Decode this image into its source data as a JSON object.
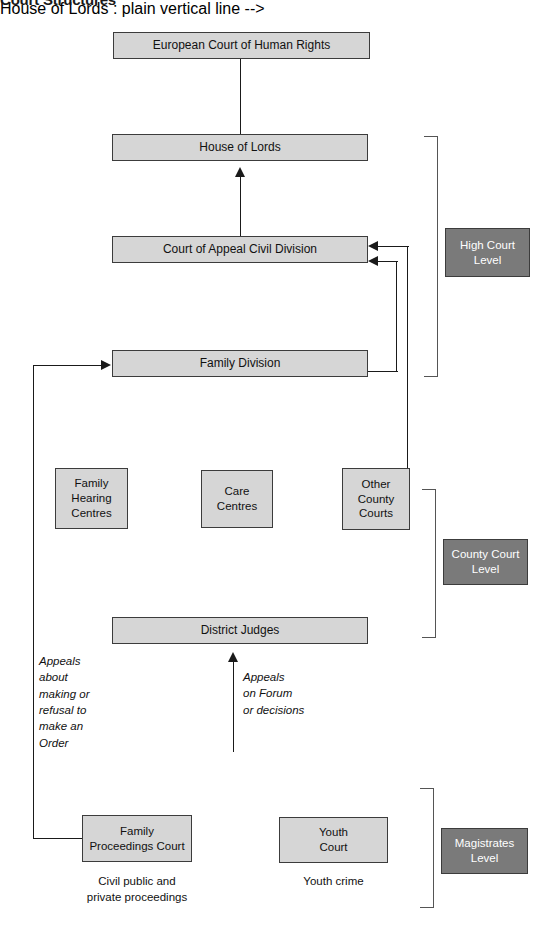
{
  "title": "Court Structures",
  "nodes": {
    "echr": "European Court of Human Rights",
    "house_of_lords": "House of Lords",
    "court_of_appeal": "Court of Appeal Civil Division",
    "family_division": "Family Division",
    "family_hearing_centres": "Family\nHearing\nCentres",
    "care_centres": "Care\nCentres",
    "other_county_courts": "Other\nCounty\nCourts",
    "district_judges": "District Judges",
    "family_proceedings_court": "Family\nProceedings Court",
    "youth_court": "Youth\nCourt"
  },
  "level_badges": {
    "high_court": "High Court\nLevel",
    "county_court": "County Court\nLevel",
    "magistrates": "Magistrates\nLevel"
  },
  "annotations": {
    "appeals_order": "Appeals\nabout\nmaking or\nrefusal to\nmake an\nOrder",
    "appeals_forum": "Appeals\non Forum\nor decisions"
  },
  "captions": {
    "family_proceedings": "Civil public and\nprivate proceedings",
    "youth_court": "Youth crime"
  },
  "colors": {
    "node_fill": "#d6d6d6",
    "node_border": "#3c3c3c",
    "badge_fill": "#7a7a7a",
    "badge_text": "#ffffff",
    "connector": "#1a1a1a",
    "bracket": "#555555",
    "background": "#ffffff"
  }
}
